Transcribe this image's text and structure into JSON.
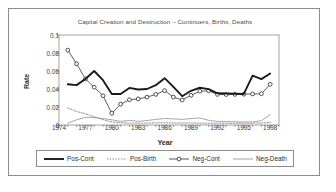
{
  "chart_data": {
    "type": "line",
    "title": "Capital Creation and Destruction – Continuers, Births, Deaths",
    "xlabel": "Year",
    "ylabel": "Rate",
    "grid": false,
    "legend_position": "bottom",
    "xlim": [
      1974,
      1999
    ],
    "ylim": [
      0,
      0.1
    ],
    "xticks": [
      "1974",
      "1977",
      "1980",
      "1983",
      "1986",
      "1989",
      "1992",
      "1995",
      "1998"
    ],
    "xtick_values": [
      1974,
      1977,
      1980,
      1983,
      1986,
      1989,
      1992,
      1995,
      1998
    ],
    "yticks": [
      "0",
      "0.02",
      "0.04",
      "0.06",
      "0.08",
      "0.1"
    ],
    "ytick_values": [
      0,
      0.02,
      0.04,
      0.06,
      0.08,
      0.1
    ],
    "x": [
      1975,
      1976,
      1977,
      1978,
      1979,
      1980,
      1981,
      1982,
      1983,
      1984,
      1985,
      1986,
      1987,
      1988,
      1989,
      1990,
      1991,
      1992,
      1993,
      1994,
      1995,
      1996,
      1997,
      1998
    ],
    "series": [
      {
        "name": "Pos-Cont",
        "style": "thick-solid",
        "color": "#1a1a1a",
        "marker": "none",
        "values": [
          0.0452,
          0.0443,
          0.0512,
          0.06,
          0.0498,
          0.0345,
          0.0344,
          0.0412,
          0.0395,
          0.04,
          0.0442,
          0.052,
          0.0423,
          0.032,
          0.038,
          0.0414,
          0.0398,
          0.0352,
          0.035,
          0.0348,
          0.0345,
          0.0548,
          0.051,
          0.0572
        ]
      },
      {
        "name": "Pos-Birth",
        "style": "dotted",
        "color": "#7a7a7a",
        "marker": "none",
        "values": [
          0.019,
          0.015,
          0.0125,
          0.009,
          0.006,
          0.0035,
          0.0024,
          0.0022,
          0.002,
          0.0022,
          0.0024,
          0.0024,
          0.0023,
          0.0022,
          0.0022,
          0.0021,
          0.002,
          0.002,
          0.0019,
          0.0019,
          0.0019,
          0.002,
          0.0022,
          0.0028
        ]
      },
      {
        "name": "Neg-Cont",
        "style": "thin-solid",
        "color": "#2a2a2a",
        "marker": "circle",
        "values": [
          0.0832,
          0.068,
          0.0512,
          0.042,
          0.0325,
          0.013,
          0.0232,
          0.028,
          0.029,
          0.031,
          0.034,
          0.0382,
          0.031,
          0.0278,
          0.033,
          0.0375,
          0.038,
          0.034,
          0.0338,
          0.034,
          0.0342,
          0.0345,
          0.0347,
          0.0452
        ]
      },
      {
        "name": "Neg-Death",
        "style": "thin-solid",
        "color": "#8a8a8a",
        "marker": "none",
        "values": [
          0.002,
          0.0058,
          0.0085,
          0.0082,
          0.0072,
          0.0058,
          0.004,
          0.0052,
          0.004,
          0.005,
          0.0062,
          0.0072,
          0.0068,
          0.0062,
          0.0072,
          0.0078,
          0.0052,
          0.004,
          0.0038,
          0.0036,
          0.0034,
          0.0034,
          0.0048,
          0.0115
        ]
      }
    ]
  },
  "legend": {
    "items": [
      {
        "label": "Pos-Cont",
        "style": "thick-solid",
        "marker": "none"
      },
      {
        "label": "Pos-Birth",
        "style": "dotted",
        "marker": "none"
      },
      {
        "label": "Neg-Cont",
        "style": "thin-solid",
        "marker": "circle"
      },
      {
        "label": "Neg-Death",
        "style": "thin-solid",
        "marker": "none"
      }
    ]
  },
  "colors": {
    "frame": "#8d8d8d",
    "axis": "#5a5a5a",
    "title": "#4a4a4a",
    "text": "#2f2f2f"
  }
}
